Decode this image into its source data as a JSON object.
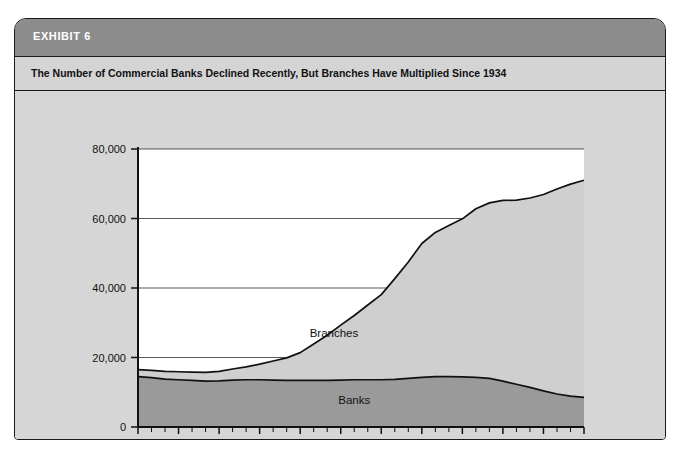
{
  "exhibit": {
    "label": "EXHIBIT 6",
    "subtitle": "The Number of Commercial Banks Declined Recently, But Branches Have Multiplied Since 1934"
  },
  "colors": {
    "header_bar": "#8c8c8c",
    "subtitle_band": "#d4d4d4",
    "card_background": "#d6d6d6",
    "plot_background": "#ffffff",
    "branches_fill": "#cfcfcf",
    "banks_fill": "#9a9a9a",
    "line": "#111111",
    "border": "#1a1a1a"
  },
  "chart_data": {
    "type": "area",
    "stacked": true,
    "title": "The Number of Commercial Banks Declined Recently, But Branches Have Multiplied Since 1934",
    "xlabel": "",
    "ylabel": "",
    "xlim": [
      1934,
      2000
    ],
    "ylim": [
      0,
      80000
    ],
    "grid": true,
    "legend_position": "inline-annotation",
    "x_tick_labels": [
      "1934",
      "1940",
      "1946",
      "1952",
      "1958",
      "1964",
      "1970",
      "1976",
      "1982",
      "1988",
      "1994",
      "2000"
    ],
    "x_tick_values": [
      1934,
      1940,
      1946,
      1952,
      1958,
      1964,
      1970,
      1976,
      1982,
      1988,
      1994,
      2000
    ],
    "x_minor_tick_interval": 2,
    "y_tick_labels": [
      "0",
      "20,000",
      "40,000",
      "60,000",
      "80,000"
    ],
    "y_tick_values": [
      0,
      20000,
      40000,
      60000,
      80000
    ],
    "x": [
      1934,
      1936,
      1938,
      1940,
      1942,
      1944,
      1946,
      1948,
      1950,
      1952,
      1954,
      1956,
      1958,
      1960,
      1962,
      1964,
      1966,
      1968,
      1970,
      1972,
      1974,
      1976,
      1978,
      1980,
      1982,
      1984,
      1986,
      1988,
      1990,
      1992,
      1994,
      1996,
      1998,
      2000
    ],
    "series": [
      {
        "name": "Banks",
        "label": "Banks",
        "color": "#9a9a9a",
        "values": [
          14500,
          14200,
          13800,
          13600,
          13400,
          13200,
          13300,
          13500,
          13600,
          13600,
          13500,
          13400,
          13400,
          13400,
          13400,
          13500,
          13600,
          13600,
          13600,
          13700,
          14000,
          14300,
          14500,
          14500,
          14400,
          14300,
          14000,
          13200,
          12300,
          11400,
          10400,
          9500,
          8900,
          8500
        ]
      },
      {
        "name": "Branches",
        "label": "Branches",
        "color": "#cfcfcf",
        "values": [
          2000,
          2100,
          2200,
          2300,
          2400,
          2500,
          2700,
          3200,
          3700,
          4500,
          5500,
          6500,
          8000,
          10500,
          13000,
          15800,
          18500,
          21500,
          24500,
          29000,
          33500,
          38500,
          41500,
          43500,
          45500,
          48500,
          50500,
          52000,
          53000,
          54500,
          56500,
          59000,
          61000,
          62500
        ]
      }
    ],
    "totals": [
      16500,
      16300,
      16000,
      15900,
      15800,
      15700,
      16000,
      16700,
      17300,
      18100,
      19000,
      19900,
      21400,
      23900,
      26400,
      29300,
      32100,
      35100,
      38100,
      42700,
      47500,
      52800,
      56000,
      58000,
      59900,
      62800,
      64500,
      65200,
      65300,
      65900,
      66900,
      68500,
      69900,
      71000
    ],
    "annotations": [
      {
        "text": "Branches",
        "x": 1963,
        "y": 26000
      },
      {
        "text": "Banks",
        "x": 1966,
        "y": 6500
      }
    ]
  }
}
